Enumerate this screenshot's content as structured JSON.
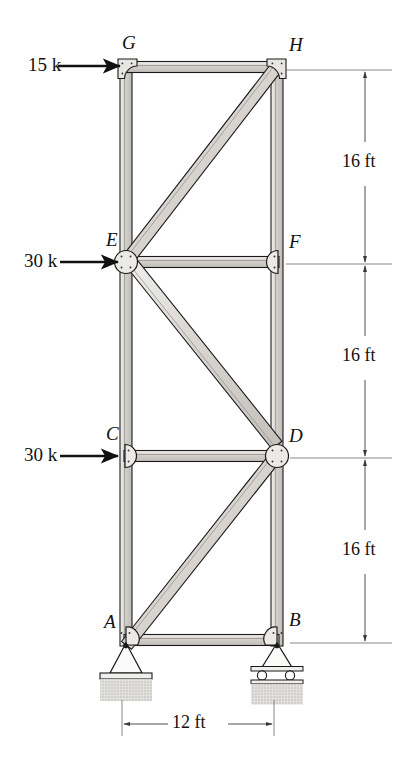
{
  "figure": {
    "type": "structural-truss-diagram"
  },
  "joints": [
    {
      "id": "A",
      "label": "A",
      "x": 126,
      "y": 640,
      "gusset": "pin-plate",
      "label_dx": -22,
      "label_dy": -22
    },
    {
      "id": "B",
      "label": "B",
      "x": 277,
      "y": 640,
      "gusset": "roller-plate",
      "label_dx": 12,
      "label_dy": -26
    },
    {
      "id": "C",
      "label": "C",
      "x": 126,
      "y": 456,
      "gusset": "half-right",
      "label_dx": -20,
      "label_dy": -28
    },
    {
      "id": "D",
      "label": "D",
      "x": 277,
      "y": 456,
      "gusset": "circle",
      "label_dx": 12,
      "label_dy": -26
    },
    {
      "id": "E",
      "label": "E",
      "x": 126,
      "y": 262,
      "gusset": "circle",
      "label_dx": -20,
      "label_dy": -28
    },
    {
      "id": "F",
      "label": "F",
      "x": 277,
      "y": 262,
      "gusset": "half-left",
      "label_dx": 12,
      "label_dy": -26
    },
    {
      "id": "G",
      "label": "G",
      "x": 126,
      "y": 67,
      "gusset": "square-tl",
      "label_dx": -4,
      "label_dy": -30
    },
    {
      "id": "H",
      "label": "H",
      "x": 277,
      "y": 67,
      "gusset": "square-tr",
      "label_dx": 12,
      "label_dy": -30
    }
  ],
  "members": [
    {
      "from": "A",
      "to": "C",
      "kind": "chord-vertical"
    },
    {
      "from": "C",
      "to": "E",
      "kind": "chord-vertical"
    },
    {
      "from": "E",
      "to": "G",
      "kind": "chord-vertical"
    },
    {
      "from": "B",
      "to": "D",
      "kind": "chord-vertical"
    },
    {
      "from": "D",
      "to": "F",
      "kind": "chord-vertical"
    },
    {
      "from": "F",
      "to": "H",
      "kind": "chord-vertical"
    },
    {
      "from": "A",
      "to": "B",
      "kind": "chord-horizontal"
    },
    {
      "from": "C",
      "to": "D",
      "kind": "chord-horizontal"
    },
    {
      "from": "E",
      "to": "F",
      "kind": "chord-horizontal"
    },
    {
      "from": "G",
      "to": "H",
      "kind": "chord-horizontal"
    },
    {
      "from": "A",
      "to": "D",
      "kind": "diagonal"
    },
    {
      "from": "E",
      "to": "D",
      "kind": "diagonal"
    },
    {
      "from": "E",
      "to": "H",
      "kind": "diagonal"
    }
  ],
  "loads": [
    {
      "id": "load-G",
      "text": "15 k",
      "at_joint": "G",
      "direction": "right",
      "text_x": 28,
      "text_y": 55,
      "arrow_x1": 58,
      "arrow_x2": 120,
      "arrow_y": 66
    },
    {
      "id": "load-E",
      "text": "30 k",
      "at_joint": "E",
      "direction": "right",
      "text_x": 24,
      "text_y": 251,
      "arrow_x1": 60,
      "arrow_x2": 118,
      "arrow_y": 262
    },
    {
      "id": "load-C",
      "text": "30 k",
      "at_joint": "C",
      "direction": "right",
      "text_x": 24,
      "text_y": 445,
      "arrow_x1": 60,
      "arrow_x2": 118,
      "arrow_y": 456
    }
  ],
  "supports": [
    {
      "at_joint": "A",
      "type": "pin",
      "name": "pin-support"
    },
    {
      "at_joint": "B",
      "type": "roller",
      "name": "roller-support"
    }
  ],
  "dimensions": {
    "vertical": [
      {
        "id": "dim-GH-EF",
        "text": "16 ft",
        "from_y": 67,
        "to_y": 262,
        "line_x": 365,
        "text_x": 371,
        "text_y": 158
      },
      {
        "id": "dim-EF-CD",
        "text": "16 ft",
        "from_y": 262,
        "to_y": 456,
        "line_x": 365,
        "text_x": 371,
        "text_y": 352
      },
      {
        "id": "dim-CD-AB",
        "text": "16 ft",
        "from_y": 456,
        "to_y": 640,
        "line_x": 365,
        "text_x": 371,
        "text_y": 546
      }
    ],
    "horizontal": [
      {
        "id": "dim-span",
        "text": "12 ft",
        "from_x": 122,
        "to_x": 274,
        "line_y": 724,
        "text_x": 175,
        "text_y": 714
      }
    ]
  },
  "colors": {
    "outline": "#1a1a1a",
    "member_fill": "#d8d5d0",
    "member_fill_light": "#ebe9e5",
    "gusset_fill": "#e8e6e2",
    "ground_hatch": "#cfcdc9",
    "dim_line": "#4a4a4a",
    "background": "#ffffff"
  }
}
